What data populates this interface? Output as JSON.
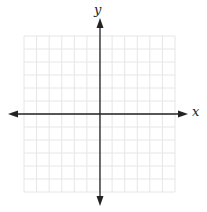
{
  "diagram": {
    "type": "coordinate-plane",
    "grid": {
      "columns": 12,
      "rows": 12,
      "left": 24,
      "top": 36,
      "right": 175,
      "bottom": 192,
      "color": "#e6e6e6"
    },
    "origin": {
      "x": 100,
      "y": 114
    },
    "axes": {
      "color": "#222222",
      "x": {
        "label": "x",
        "from": 8,
        "to": 188
      },
      "y": {
        "label": "y",
        "from": 18,
        "to": 206
      }
    }
  }
}
